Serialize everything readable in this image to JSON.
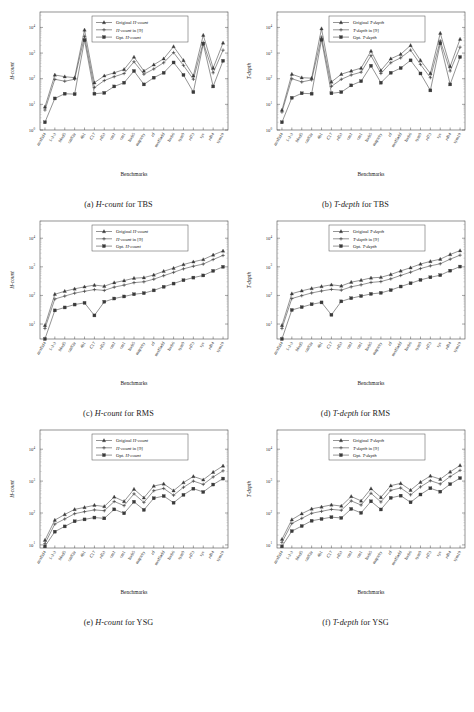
{
  "figure": {
    "xlabel": "Benchmarks",
    "benchmarks": [
      "mod5d4",
      "1-2-3",
      "Mod5",
      "cm82a",
      "4b1",
      "C17",
      "rd53",
      "cm2",
      "cm1",
      "hwb5",
      "majority",
      "rd",
      "mod5add",
      "hwb6",
      "sym9",
      "rd73",
      "sys",
      "rd84",
      "sym10"
    ]
  },
  "panels": [
    {
      "id": "a",
      "caption_prefix": "(a)",
      "caption_metric": "H-count",
      "caption_suffix": "for TBS",
      "ylabel": "H-count",
      "legend": [
        "Original H-count",
        "H-count in [9]",
        "Opt. H-count"
      ]
    },
    {
      "id": "b",
      "caption_prefix": "(b)",
      "caption_metric": "T-depth",
      "caption_suffix": "for TBS",
      "ylabel": "T-depth",
      "legend": [
        "Original T-depth",
        "T-depth in [9]",
        "Opt. T-depth"
      ]
    },
    {
      "id": "c",
      "caption_prefix": "(c)",
      "caption_metric": "H-count",
      "caption_suffix": "for RMS",
      "ylabel": "H-count",
      "legend": [
        "Original H-count",
        "H-count in [9]",
        "Opt. H-count"
      ]
    },
    {
      "id": "d",
      "caption_prefix": "(d)",
      "caption_metric": "T-depth",
      "caption_suffix": "for RMS",
      "ylabel": "T-depth",
      "legend": [
        "Original T-depth",
        "T-depth in [9]",
        "Opt. T-depth"
      ]
    },
    {
      "id": "e",
      "caption_prefix": "(e)",
      "caption_metric": "H-count",
      "caption_suffix": "for YSG",
      "ylabel": "H-count",
      "legend": [
        "Original H-count",
        "H-count in [9]",
        "Opt. H-count"
      ]
    },
    {
      "id": "f",
      "caption_prefix": "(f)",
      "caption_metric": "T-depth",
      "caption_suffix": "for YSG",
      "ylabel": "T-depth",
      "legend": [
        "Original T-depth",
        "T-depth in [9]",
        "Opt. T-depth"
      ]
    }
  ],
  "chart_data": [
    {
      "type": "line",
      "id": "a",
      "title": "(a) H-count for TBS",
      "xlabel": "Benchmarks",
      "ylabel": "H-count",
      "yscale": "log",
      "ylim": [
        1,
        40000
      ],
      "yticks": [
        1,
        10,
        100,
        1000,
        10000
      ],
      "yticklabels": [
        "10^0",
        "10^1",
        "10^2",
        "10^3",
        "10^4"
      ],
      "grid": false,
      "legend_position": "upper center",
      "categories": [
        "mod5d4",
        "1-2-3",
        "Mod5",
        "cm82a",
        "4b1",
        "C17",
        "rd53",
        "cm2",
        "cm1",
        "hwb5",
        "majority",
        "rd",
        "mod5add",
        "hwb6",
        "sym9",
        "rd73",
        "sys",
        "rd84",
        "sym10"
      ],
      "series": [
        {
          "name": "Original H-count",
          "marker": "triangle",
          "values": [
            8,
            140,
            120,
            110,
            8000,
            70,
            130,
            170,
            230,
            700,
            200,
            350,
            600,
            1800,
            520,
            130,
            5000,
            260,
            2500
          ]
        },
        {
          "name": "H-count in [9]",
          "marker": "plus",
          "values": [
            6,
            95,
            80,
            95,
            4500,
            45,
            85,
            120,
            160,
            460,
            150,
            240,
            420,
            1050,
            330,
            95,
            2600,
            170,
            1300
          ]
        },
        {
          "name": "Opt. H-count",
          "marker": "square",
          "values": [
            2,
            17,
            26,
            25,
            3200,
            26,
            28,
            50,
            70,
            200,
            60,
            110,
            170,
            430,
            140,
            30,
            2300,
            50,
            500
          ]
        }
      ]
    },
    {
      "type": "line",
      "id": "b",
      "title": "(b) T-depth for TBS",
      "xlabel": "Benchmarks",
      "ylabel": "T-depth",
      "yscale": "log",
      "ylim": [
        1,
        40000
      ],
      "yticks": [
        1,
        10,
        100,
        1000,
        10000
      ],
      "yticklabels": [
        "10^0",
        "10^1",
        "10^2",
        "10^3",
        "10^4"
      ],
      "grid": false,
      "legend_position": "upper center",
      "categories": [
        "mod5d4",
        "1-2-3",
        "Mod5",
        "cm82a",
        "4b1",
        "C17",
        "rd53",
        "cm2",
        "cm1",
        "hwb5",
        "majority",
        "rd",
        "mod5add",
        "hwb6",
        "sym9",
        "rd73",
        "sys",
        "rd84",
        "sym10"
      ],
      "series": [
        {
          "name": "Original T-depth",
          "marker": "triangle",
          "values": [
            6,
            150,
            110,
            105,
            9000,
            75,
            150,
            200,
            260,
            1200,
            210,
            600,
            900,
            2000,
            520,
            160,
            6000,
            300,
            3500
          ]
        },
        {
          "name": "T-depth in [9]",
          "marker": "plus",
          "values": [
            5,
            100,
            75,
            90,
            4200,
            50,
            95,
            140,
            180,
            800,
            160,
            420,
            650,
            1300,
            360,
            110,
            3000,
            200,
            1700
          ]
        },
        {
          "name": "Opt. T-depth",
          "marker": "square",
          "values": [
            2,
            18,
            27,
            26,
            3300,
            27,
            30,
            55,
            80,
            320,
            70,
            170,
            260,
            520,
            160,
            35,
            2400,
            60,
            700
          ]
        }
      ]
    },
    {
      "type": "line",
      "id": "c",
      "title": "(c) H-count for RMS",
      "xlabel": "Benchmarks",
      "ylabel": "H-count",
      "yscale": "log",
      "ylim": [
        3,
        40000
      ],
      "yticks": [
        10,
        100,
        1000,
        10000
      ],
      "yticklabels": [
        "10^1",
        "10^2",
        "10^3",
        "10^4"
      ],
      "grid": false,
      "legend_position": "upper center",
      "categories": [
        "mod5d4",
        "1-2-3",
        "Mod5",
        "cm82a",
        "4b1",
        "C17",
        "rd53",
        "cm2",
        "cm1",
        "hwb5",
        "majority",
        "rd",
        "mod5add",
        "hwb6",
        "sym9",
        "rd73",
        "sys",
        "rd84",
        "sym10"
      ],
      "series": [
        {
          "name": "Original H-count",
          "marker": "triangle",
          "values": [
            9,
            110,
            140,
            170,
            200,
            230,
            210,
            280,
            330,
            400,
            420,
            520,
            700,
            900,
            1200,
            1500,
            1800,
            2600,
            3600
          ]
        },
        {
          "name": "H-count in [9]",
          "marker": "plus",
          "values": [
            7,
            75,
            95,
            120,
            140,
            160,
            150,
            195,
            230,
            280,
            300,
            370,
            490,
            640,
            850,
            1050,
            1250,
            1800,
            2500
          ]
        },
        {
          "name": "Opt. H-count",
          "marker": "square",
          "values": [
            3,
            30,
            38,
            48,
            55,
            20,
            60,
            78,
            92,
            110,
            120,
            150,
            200,
            260,
            340,
            420,
            500,
            720,
            1000
          ]
        }
      ]
    },
    {
      "type": "line",
      "id": "d",
      "title": "(d) T-depth for RMS",
      "xlabel": "Benchmarks",
      "ylabel": "T-depth",
      "yscale": "log",
      "ylim": [
        3,
        40000
      ],
      "yticks": [
        10,
        100,
        1000,
        10000
      ],
      "yticklabels": [
        "10^1",
        "10^2",
        "10^3",
        "10^4"
      ],
      "grid": false,
      "legend_position": "upper center",
      "categories": [
        "mod5d4",
        "1-2-3",
        "Mod5",
        "cm82a",
        "4b1",
        "C17",
        "rd53",
        "cm2",
        "cm1",
        "hwb5",
        "majority",
        "rd",
        "mod5add",
        "hwb6",
        "sym9",
        "rd73",
        "sys",
        "rd84",
        "sym10"
      ],
      "series": [
        {
          "name": "Original T-depth",
          "marker": "triangle",
          "values": [
            9,
            115,
            145,
            175,
            205,
            235,
            215,
            290,
            340,
            410,
            430,
            540,
            720,
            930,
            1250,
            1550,
            1850,
            2700,
            3700
          ]
        },
        {
          "name": "T-depth in [9]",
          "marker": "plus",
          "values": [
            7,
            78,
            98,
            122,
            143,
            163,
            153,
            200,
            235,
            285,
            305,
            380,
            500,
            650,
            870,
            1080,
            1280,
            1850,
            2550
          ]
        },
        {
          "name": "Opt. T-depth",
          "marker": "square",
          "values": [
            3,
            31,
            39,
            49,
            57,
            21,
            62,
            80,
            95,
            113,
            123,
            153,
            205,
            266,
            348,
            430,
            510,
            735,
            1020
          ]
        }
      ]
    },
    {
      "type": "line",
      "id": "e",
      "title": "(e) H-count for YSG",
      "xlabel": "Benchmarks",
      "ylabel": "H-count",
      "yscale": "log",
      "ylim": [
        8,
        40000
      ],
      "yticks": [
        10,
        100,
        1000,
        10000
      ],
      "yticklabels": [
        "10^1",
        "10^2",
        "10^3",
        "10^4"
      ],
      "grid": false,
      "legend_position": "upper center",
      "categories": [
        "mod5d4",
        "1-2-3",
        "Mod5",
        "cm82a",
        "4b1",
        "C17",
        "rd53",
        "cm2",
        "cm1",
        "hwb5",
        "majority",
        "rd",
        "mod5add",
        "hwb6",
        "sym9",
        "rd73",
        "sys",
        "rd84",
        "sym10"
      ],
      "series": [
        {
          "name": "Original H-count",
          "marker": "triangle",
          "values": [
            14,
            60,
            90,
            130,
            150,
            175,
            160,
            320,
            230,
            560,
            300,
            700,
            820,
            500,
            900,
            1400,
            1100,
            1900,
            3000
          ]
        },
        {
          "name": "H-count in [9]",
          "marker": "plus",
          "values": [
            11,
            45,
            65,
            95,
            110,
            125,
            118,
            230,
            170,
            400,
            215,
            500,
            590,
            360,
            640,
            1000,
            790,
            1350,
            2100
          ]
        },
        {
          "name": "Opt. H-count",
          "marker": "square",
          "values": [
            9,
            26,
            38,
            55,
            63,
            72,
            68,
            130,
            98,
            225,
            125,
            290,
            340,
            210,
            370,
            580,
            455,
            780,
            1200
          ]
        }
      ]
    },
    {
      "type": "line",
      "id": "f",
      "title": "(f) T-depth for YSG",
      "xlabel": "Benchmarks",
      "ylabel": "T-depth",
      "yscale": "log",
      "ylim": [
        8,
        40000
      ],
      "yticks": [
        10,
        100,
        1000,
        10000
      ],
      "yticklabels": [
        "10^1",
        "10^2",
        "10^3",
        "10^4"
      ],
      "grid": false,
      "legend_position": "upper center",
      "categories": [
        "mod5d4",
        "1-2-3",
        "Mod5",
        "cm82a",
        "4b1",
        "C17",
        "rd53",
        "cm2",
        "cm1",
        "hwb5",
        "majority",
        "rd",
        "mod5add",
        "hwb6",
        "sym9",
        "rd73",
        "sys",
        "rd84",
        "sym10"
      ],
      "series": [
        {
          "name": "Original T-depth",
          "marker": "triangle",
          "values": [
            15,
            62,
            95,
            135,
            155,
            180,
            165,
            330,
            240,
            580,
            310,
            720,
            850,
            520,
            930,
            1450,
            1150,
            1950,
            3100
          ]
        },
        {
          "name": "T-depth in [9]",
          "marker": "plus",
          "values": [
            12,
            47,
            68,
            98,
            113,
            130,
            122,
            240,
            178,
            415,
            222,
            515,
            610,
            372,
            660,
            1030,
            815,
            1390,
            2170
          ]
        },
        {
          "name": "Opt. T-depth",
          "marker": "square",
          "values": [
            9,
            27,
            39,
            57,
            65,
            74,
            70,
            134,
            101,
            232,
            129,
            298,
            350,
            216,
            380,
            597,
            468,
            802,
            1240
          ]
        }
      ]
    }
  ]
}
